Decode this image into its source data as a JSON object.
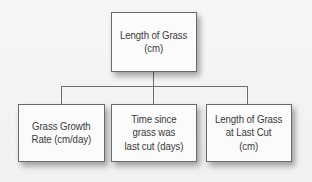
{
  "diagram": {
    "type": "tree",
    "root": {
      "label": "Length of Grass\n(cm)"
    },
    "children": [
      {
        "label": "Grass Growth\nRate (cm/day)"
      },
      {
        "label": "Time since\ngrass was\nlast cut (days)"
      },
      {
        "label": "Length of Grass\nat Last Cut\n(cm)"
      }
    ]
  },
  "colors": {
    "background": "#f4f4f4",
    "box_fill": "#fbfbfb",
    "box_border": "#6a6a6a",
    "connector": "#6e6e6e",
    "text": "#3a3a3a"
  }
}
